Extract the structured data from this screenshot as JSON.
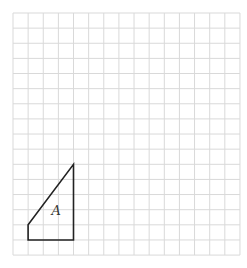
{
  "figure": {
    "grid": {
      "columns": 15,
      "rows": 16,
      "origin_x": 13,
      "origin_y": 13,
      "cell_size": 15.13,
      "line_color": "#d9d9d9"
    },
    "shape": {
      "label": "A",
      "vertices_grid": [
        [
          1,
          14
        ],
        [
          1,
          15
        ],
        [
          4,
          15
        ],
        [
          4,
          10
        ]
      ],
      "stroke_color": "#222222"
    }
  }
}
